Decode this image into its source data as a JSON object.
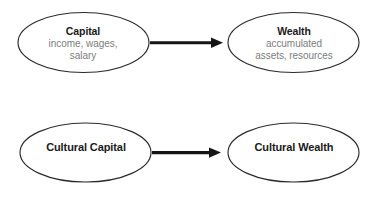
{
  "diagram": {
    "type": "flow",
    "background_color": "#ffffff",
    "stroke_color": "#2b2b2b",
    "arrow_color": "#151515",
    "title_color": "#1a1a1a",
    "subtitle_color": "#7d7d7d",
    "rows": [
      {
        "id": "row-economic",
        "source": {
          "id": "capital",
          "title": "Capital",
          "subtitle_lines": [
            "income, wages,",
            "salary"
          ]
        },
        "target": {
          "id": "wealth",
          "title": "Wealth",
          "subtitle_lines": [
            "accumulated",
            "assets, resources"
          ]
        },
        "connector": {
          "id": "arrow-capital-to-wealth",
          "kind": "arrow",
          "direction": "right"
        }
      },
      {
        "id": "row-cultural",
        "source": {
          "id": "cultural-capital",
          "title": "Cultural Capital",
          "subtitle_lines": []
        },
        "target": {
          "id": "cultural-wealth",
          "title": "Cultural Wealth",
          "subtitle_lines": []
        },
        "connector": {
          "id": "arrow-cultural-capital-to-cultural-wealth",
          "kind": "arrow",
          "direction": "right"
        }
      }
    ]
  }
}
